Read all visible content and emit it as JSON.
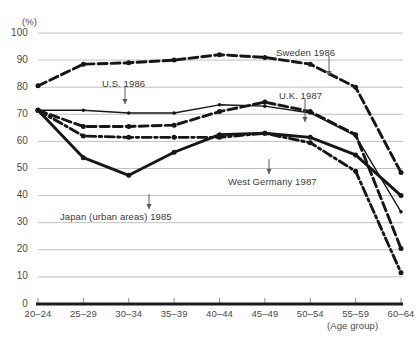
{
  "chart_data": {
    "type": "line",
    "title": "",
    "xlabel": "(Age group)",
    "ylabel": "(%)",
    "unit_label": "(%)",
    "categories": [
      "20–24",
      "25–29",
      "30–34",
      "35–39",
      "40–44",
      "45–49",
      "50–54",
      "55–59",
      "60–64"
    ],
    "ylim": [
      0,
      100
    ],
    "yticks": [
      "0",
      "10",
      "20",
      "30",
      "40",
      "50",
      "60",
      "70",
      "80",
      "90",
      "100"
    ],
    "grid": true,
    "legend_position": "annotations-inline",
    "series": [
      {
        "name": "Sweden 1986",
        "style": "dashed",
        "width": "thick",
        "values": [
          80.5,
          88.5,
          89.0,
          90.0,
          92.0,
          91.0,
          88.5,
          80.0,
          48.5
        ]
      },
      {
        "name": "U.S. 1986",
        "style": "solid",
        "width": "thin",
        "values": [
          71.5,
          71.5,
          70.5,
          70.5,
          73.5,
          73.0,
          70.5,
          62.0,
          34.0
        ]
      },
      {
        "name": "U.K. 1987",
        "style": "dashed",
        "width": "thick",
        "values": [
          71.5,
          65.5,
          65.5,
          66.0,
          71.0,
          74.5,
          71.0,
          62.5,
          20.5
        ]
      },
      {
        "name": "West Germany 1987",
        "style": "dash-dot",
        "width": "thick",
        "values": [
          71.5,
          62.0,
          61.5,
          61.5,
          61.5,
          63.0,
          59.5,
          49.0,
          11.5
        ]
      },
      {
        "name": "Japan (urban areas) 1985",
        "style": "solid",
        "width": "thick",
        "values": [
          71.5,
          54.0,
          47.5,
          56.0,
          62.5,
          63.0,
          61.5,
          55.0,
          40.0
        ]
      }
    ],
    "annotations": [
      {
        "label": "Sweden 1986",
        "text_x": 276,
        "text_y": 47,
        "arrow_x": 329,
        "arrow_y0": 56,
        "arrow_y1": 76
      },
      {
        "label": "U.S. 1986",
        "text_x": 102,
        "text_y": 78,
        "arrow_x": 125,
        "arrow_y0": 87,
        "arrow_y1": 104
      },
      {
        "label": "U.K. 1987",
        "text_x": 279,
        "text_y": 90,
        "arrow_x": 305,
        "arrow_y0": 99,
        "arrow_y1": 122
      },
      {
        "label": "West Germany 1987",
        "text_x": 228,
        "text_y": 176,
        "arrow_x": 269,
        "arrow_y0": 159,
        "arrow_y1": 174
      },
      {
        "label": "Japan (urban areas) 1985",
        "text_x": 60,
        "text_y": 211,
        "arrow_x": 149,
        "arrow_y0": 194,
        "arrow_y1": 209
      }
    ]
  }
}
